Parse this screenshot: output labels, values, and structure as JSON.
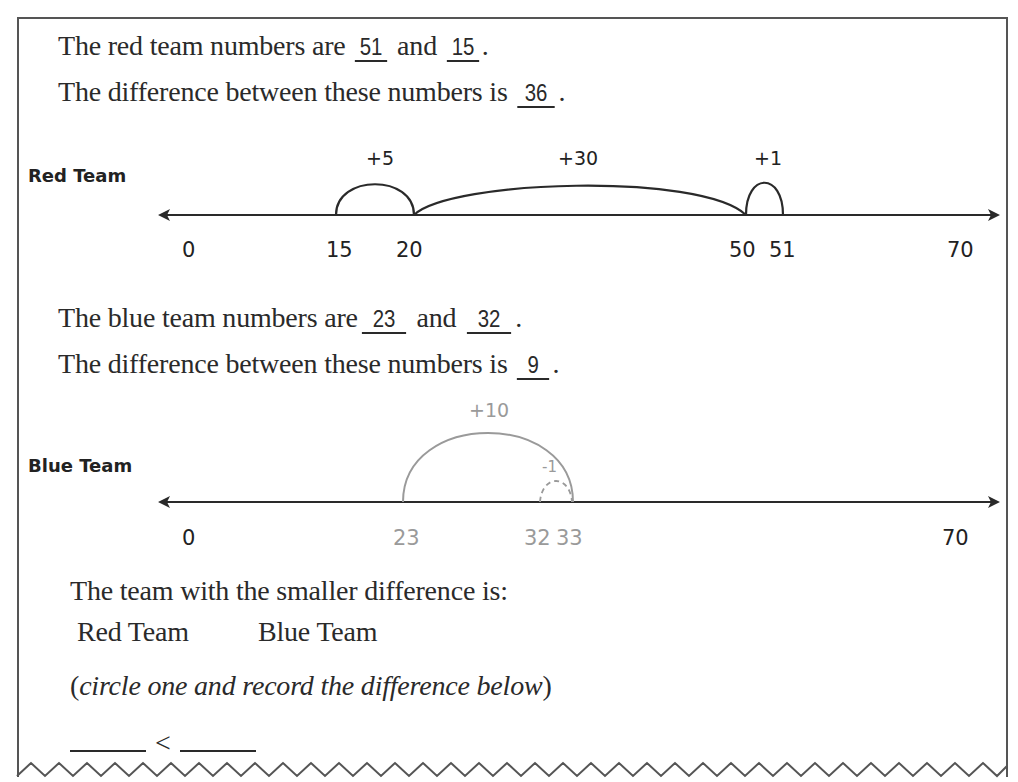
{
  "worksheet": {
    "red_section": {
      "numbers_sentence_prefix": "The red team numbers are ",
      "number_a": "51",
      "connector": " and ",
      "number_b": "15",
      "period": ".",
      "difference_sentence_prefix": "The difference between these numbers is ",
      "difference": "36",
      "team_label": "Red Team",
      "number_line": {
        "ticks": [
          "0",
          "15",
          "20",
          "50",
          "51",
          "70"
        ],
        "jumps": [
          "+5",
          "+30",
          "+1"
        ]
      }
    },
    "blue_section": {
      "numbers_sentence_prefix": "The blue team numbers are",
      "number_a": "23",
      "connector": " and ",
      "number_b": "32",
      "period": ".",
      "difference_sentence_prefix": "The difference between these numbers is ",
      "difference": "9",
      "team_label": "Blue Team",
      "number_line": {
        "ticks": [
          "0",
          "23",
          "32",
          "33",
          "70"
        ],
        "jumps": [
          "+10",
          "-1"
        ]
      }
    },
    "conclusion": {
      "prompt": "The team with the smaller difference is:",
      "option_red": "Red Team",
      "option_blue": "Blue Team",
      "instruction_open": "(",
      "instruction_italic": "circle one and record the difference below",
      "instruction_close": ")",
      "comparison_symbol": "<"
    }
  },
  "colors": {
    "ink": "#222222",
    "gray_ink": "#9a9a9a",
    "border": "#555555"
  }
}
